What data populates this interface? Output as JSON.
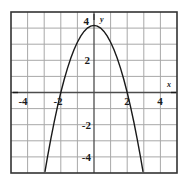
{
  "figure": {
    "name": "parabola-graph",
    "background_color": "#ffffff"
  },
  "chart_data": {
    "type": "line",
    "title": "",
    "subtitle": "",
    "xlabel": "x",
    "ylabel": "y",
    "equation": "y = -x^2 + 4",
    "xlim": [
      -5,
      5
    ],
    "ylim": [
      -4.8,
      4.8
    ],
    "grid": true,
    "grid_spacing": 1,
    "grid_color": "#a8a8a8",
    "axis_color": "#4d4d4d",
    "border_color": "#333333",
    "curve_color": "#1a1a1a",
    "legend": null,
    "legend_position": "none",
    "x_tick_labels": [
      "-4",
      "-2",
      "2",
      "4"
    ],
    "x_tick_values": [
      -4,
      -2,
      2,
      4
    ],
    "y_tick_labels": [
      "4",
      "2",
      "-2",
      "-4"
    ],
    "y_tick_values": [
      4,
      2,
      -2,
      -4
    ],
    "vertex": [
      0,
      4
    ],
    "roots": [
      -2,
      2
    ],
    "series": [
      {
        "name": "y = -x^2 + 4",
        "x": [
          -2.95,
          -2.8,
          -2.6,
          -2.4,
          -2.2,
          -2.0,
          -1.8,
          -1.6,
          -1.4,
          -1.2,
          -1.0,
          -0.8,
          -0.6,
          -0.4,
          -0.2,
          0.0,
          0.2,
          0.4,
          0.6,
          0.8,
          1.0,
          1.2,
          1.4,
          1.6,
          1.8,
          2.0,
          2.2,
          2.4,
          2.6,
          2.8,
          2.95
        ],
        "values": [
          -4.7,
          -3.84,
          -2.76,
          -1.76,
          -0.84,
          0.0,
          0.76,
          1.44,
          2.04,
          2.56,
          3.0,
          3.36,
          3.64,
          3.84,
          3.96,
          4.0,
          3.96,
          3.84,
          3.64,
          3.36,
          3.0,
          2.56,
          2.04,
          1.44,
          0.76,
          0.0,
          -0.84,
          -1.76,
          -2.76,
          -3.84,
          -4.7
        ]
      }
    ]
  },
  "labels": {
    "x_axis_name": "x",
    "y_axis_name": "y",
    "x_tick_neg4": "-4",
    "x_tick_neg2": "-2",
    "x_tick_pos2": "2",
    "x_tick_pos4": "4",
    "y_tick_pos4": "4",
    "y_tick_pos2": "2",
    "y_tick_neg2": "-2",
    "y_tick_neg4": "-4"
  }
}
